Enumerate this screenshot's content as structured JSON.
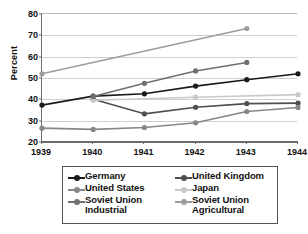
{
  "chart_data": {
    "type": "line",
    "title": "",
    "xlabel": "",
    "ylabel": "Percent",
    "categories": [
      1939,
      1940,
      1941,
      1942,
      1943,
      1944
    ],
    "xticklabels": [
      "1939",
      "1940",
      "1941",
      "1942",
      "1943",
      "1944"
    ],
    "yticklabels": [
      "20",
      "30",
      "40",
      "50",
      "60",
      "70",
      "80"
    ],
    "yticks": [
      20,
      30,
      40,
      50,
      60,
      70,
      80
    ],
    "ylim": [
      20,
      80
    ],
    "xlim": [
      1939,
      1944
    ],
    "grid": "horizontal",
    "legend_position": "below",
    "legend_columns": 2,
    "series": [
      {
        "name": "Germany",
        "color": "#1a1a1a",
        "x": [
          1939,
          1940,
          1941,
          1942,
          1943,
          1944
        ],
        "values": [
          37.3,
          41.5,
          42.6,
          46.2,
          49.2,
          52.0
        ]
      },
      {
        "name": "United Kingdom",
        "color": "#4f4f4f",
        "x": [
          1940,
          1941,
          1942,
          1943,
          1944
        ],
        "values": [
          40.0,
          33.2,
          36.3,
          38.0,
          38.2
        ]
      },
      {
        "name": "United States",
        "color": "#878787",
        "x": [
          1939,
          1940,
          1941,
          1942,
          1943,
          1944
        ],
        "values": [
          26.5,
          25.9,
          26.8,
          29.0,
          34.3,
          36.2
        ]
      },
      {
        "name": "Japan",
        "color": "#c9c9c9",
        "x": [
          1940,
          1942,
          1944
        ],
        "values": [
          39.6,
          41.0,
          42.2
        ]
      },
      {
        "name": "Soviet Union Industrial",
        "color": "#707070",
        "x": [
          1940,
          1941,
          1942,
          1943
        ],
        "values": [
          41.3,
          47.5,
          53.3,
          57.3
        ]
      },
      {
        "name": "Soviet Union Agricultural",
        "color": "#9d9d9d",
        "x": [
          1939,
          1943
        ],
        "values": [
          52.0,
          73.2
        ]
      }
    ]
  },
  "legend": {
    "entries": [
      {
        "label": "Germany",
        "color": "#1a1a1a"
      },
      {
        "label": "United Kingdom",
        "color": "#4f4f4f"
      },
      {
        "label": "United States",
        "color": "#878787"
      },
      {
        "label": "Japan",
        "color": "#c9c9c9"
      },
      {
        "label": "Soviet Union\nIndustrial",
        "color": "#707070"
      },
      {
        "label": "Soviet Union\nAgricultural",
        "color": "#9d9d9d"
      }
    ]
  }
}
